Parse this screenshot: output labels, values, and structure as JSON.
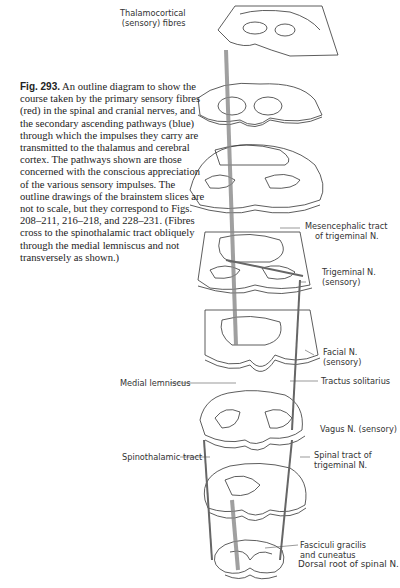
{
  "figure": {
    "number": "Fig. 293.",
    "caption": "An outline diagram to show the course taken by the primary sensory fibres (red) in the spinal and cranial nerves, and the secondary ascending pathways (blue) through which the impulses they carry are transmitted to the thalamus and cerebral cortex. The pathways shown are those concerned with the conscious appreciation of the various sensory impulses. The outline drawings of the brainstem slices are not to scale, but they correspond to Figs. 208–211, 216–218, and 228–231. (Fibres cross to the spinothalamic tract obliquely through the medial lemniscus and not transversely as shown.)"
  },
  "labels": {
    "thalamocortical_1": "Thalamocortical",
    "thalamocortical_2": "(sensory) fibres",
    "mesencephalic_1": "Mesencephalic tract",
    "mesencephalic_2": "of trigeminal N.",
    "trigeminal_1": "Trigeminal N.",
    "trigeminal_2": "(sensory)",
    "facial_1": "Facial N.",
    "facial_2": "(sensory)",
    "medial_lemniscus": "Medial lemniscus",
    "tractus_solitarius": "Tractus solitarius",
    "vagus": "Vagus N. (sensory)",
    "spinothalamic": "Spinothalamic tract",
    "spinal_tract_1": "Spinal tract of",
    "spinal_tract_2": "trigeminal N.",
    "fasciculi_1": "Fasciculi gracilis",
    "fasciculi_2": "and cuneatus",
    "dorsal_root": "Dorsal root of spinal N."
  }
}
